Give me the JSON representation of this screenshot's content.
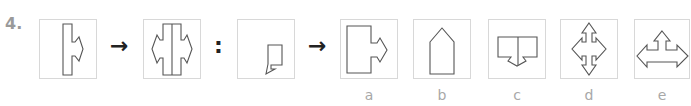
{
  "question": {
    "number": "4.",
    "relation_arrow": "→",
    "analogy_separator": ":",
    "premise_figures": [
      {
        "id": "fig1",
        "description": "tall narrow rectangle with right-pointing arrow on its right side"
      },
      {
        "id": "fig2",
        "description": "fig1 mirrored: two rectangles joined with arrows pointing left and right"
      },
      {
        "id": "fig3",
        "description": "small square with small pointed tab at bottom-left"
      }
    ],
    "options": [
      {
        "label": "a",
        "description": "large rectangle with right-pointing arrow on its right side"
      },
      {
        "label": "b",
        "description": "pentagon (house shape) pointing up"
      },
      {
        "label": "c",
        "description": "two squares joined with downward arrow at bottom center"
      },
      {
        "label": "d",
        "description": "four-way arrow cross pointing up, down, left, right"
      },
      {
        "label": "e",
        "description": "three-way arrow pointing up, left, right"
      }
    ]
  },
  "colors": {
    "stroke": "#555555",
    "box_border": "#d8d8d8",
    "label": "#a8a8a8",
    "number": "#9a9a9a"
  }
}
